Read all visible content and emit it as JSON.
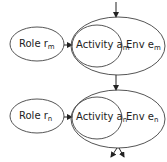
{
  "diagram": {
    "groups": [
      {
        "id": "m",
        "role": {
          "label": "Role r",
          "sub": "m"
        },
        "activity": {
          "label": "Activity a",
          "sub": "m"
        },
        "env": {
          "label": "Env e",
          "sub": "m"
        }
      },
      {
        "id": "n",
        "role": {
          "label": "Role r",
          "sub": "n"
        },
        "activity": {
          "label": "Activity a",
          "sub": "n"
        },
        "env": {
          "label": "Env e",
          "sub": "n"
        }
      }
    ],
    "colors": {
      "stroke": "#555555",
      "text": "#222222",
      "background": "#ffffff"
    }
  }
}
